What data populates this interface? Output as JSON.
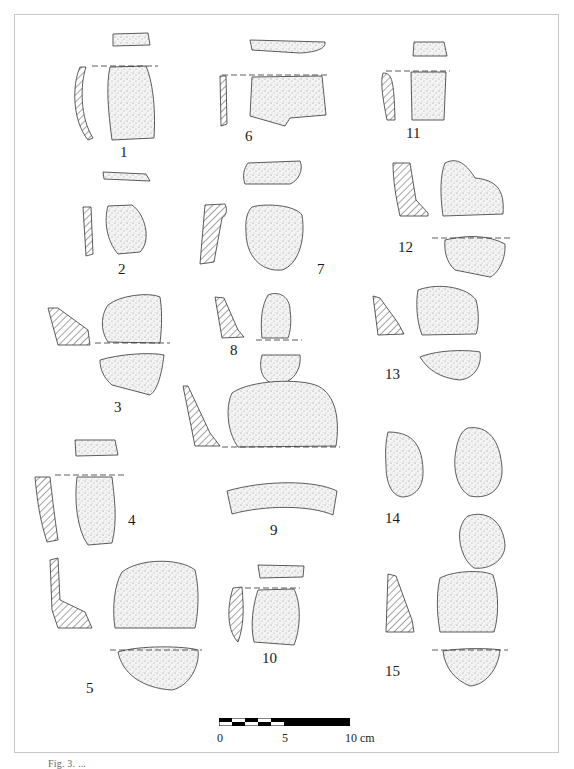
{
  "figure": {
    "type": "archaeological pottery sherd plate",
    "border_color": "#c8c8c8",
    "ink_color": "#222222",
    "stipple_color": "#888888",
    "items": [
      {
        "id": 1,
        "label": "1"
      },
      {
        "id": 2,
        "label": "2"
      },
      {
        "id": 3,
        "label": "3"
      },
      {
        "id": 4,
        "label": "4"
      },
      {
        "id": 5,
        "label": "5"
      },
      {
        "id": 6,
        "label": "6"
      },
      {
        "id": 7,
        "label": "7"
      },
      {
        "id": 8,
        "label": "8"
      },
      {
        "id": 9,
        "label": "9"
      },
      {
        "id": 10,
        "label": "10"
      },
      {
        "id": 11,
        "label": "11"
      },
      {
        "id": 12,
        "label": "12"
      },
      {
        "id": 13,
        "label": "13"
      },
      {
        "id": 14,
        "label": "14"
      },
      {
        "id": 15,
        "label": "15"
      }
    ]
  },
  "scale_bar": {
    "ticks": [
      "0",
      "5",
      "10 cm"
    ]
  },
  "caption": {
    "text": "Fig. 3. ..."
  }
}
